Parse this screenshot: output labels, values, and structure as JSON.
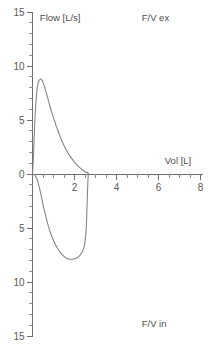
{
  "chart_data": {
    "type": "line",
    "title": "",
    "xlabel": "Vol [L]",
    "ylabel": "Flow [L/s]",
    "xlim": [
      0,
      8
    ],
    "ylim": [
      -15,
      15
    ],
    "grid": false,
    "legend": "none",
    "x_ticks": [
      0,
      2,
      4,
      6,
      8
    ],
    "x_tick_labels": [
      "",
      "2",
      "4",
      "6",
      "8"
    ],
    "y_ticks": [
      15,
      10,
      5,
      0,
      -5,
      -10,
      -15
    ],
    "y_tick_labels": [
      "15",
      "10",
      "5",
      "0",
      "5",
      "10",
      "15"
    ],
    "x_minor_step": 0.5,
    "y_minor_step": 1,
    "annotations": [
      {
        "name": "expiratory-panel-label",
        "text": "F/V ex",
        "x": 5.2,
        "y": 14.2
      },
      {
        "name": "inspiratory-panel-label",
        "text": "F/V in",
        "x": 5.2,
        "y": -14.2
      },
      {
        "name": "y-axis-title",
        "text": "Flow [L/s]",
        "x": 0.35,
        "y": 14.2
      },
      {
        "name": "x-axis-title",
        "text": "Vol [L]",
        "x": 6.3,
        "y": 0.95
      }
    ],
    "series": [
      {
        "name": "expiratory-limb",
        "stroke": "#808080",
        "points": [
          [
            0.0,
            0.0
          ],
          [
            0.04,
            1.4
          ],
          [
            0.07,
            2.9
          ],
          [
            0.1,
            4.3
          ],
          [
            0.13,
            5.6
          ],
          [
            0.17,
            6.8
          ],
          [
            0.21,
            7.7
          ],
          [
            0.26,
            8.35
          ],
          [
            0.31,
            8.65
          ],
          [
            0.38,
            8.78
          ],
          [
            0.44,
            8.72
          ],
          [
            0.5,
            8.48
          ],
          [
            0.57,
            8.1
          ],
          [
            0.64,
            7.62
          ],
          [
            0.72,
            7.08
          ],
          [
            0.8,
            6.5
          ],
          [
            0.88,
            5.95
          ],
          [
            0.96,
            5.42
          ],
          [
            1.04,
            4.98
          ],
          [
            1.1,
            4.62
          ],
          [
            1.18,
            4.18
          ],
          [
            1.27,
            3.7
          ],
          [
            1.36,
            3.24
          ],
          [
            1.46,
            2.8
          ],
          [
            1.57,
            2.36
          ],
          [
            1.69,
            1.95
          ],
          [
            1.82,
            1.56
          ],
          [
            1.95,
            1.22
          ],
          [
            2.08,
            0.92
          ],
          [
            2.2,
            0.68
          ],
          [
            2.32,
            0.48
          ],
          [
            2.42,
            0.34
          ],
          [
            2.5,
            0.22
          ],
          [
            2.56,
            0.14
          ],
          [
            2.6,
            0.18
          ],
          [
            2.63,
            0.12
          ],
          [
            2.66,
            0.02
          ]
        ]
      },
      {
        "name": "inspiratory-limb",
        "stroke": "#808080",
        "points": [
          [
            2.66,
            0.02
          ],
          [
            2.64,
            -0.6
          ],
          [
            2.62,
            -1.6
          ],
          [
            2.6,
            -2.8
          ],
          [
            2.58,
            -4.0
          ],
          [
            2.56,
            -5.0
          ],
          [
            2.53,
            -5.8
          ],
          [
            2.49,
            -6.4
          ],
          [
            2.44,
            -6.85
          ],
          [
            2.37,
            -7.2
          ],
          [
            2.28,
            -7.48
          ],
          [
            2.18,
            -7.68
          ],
          [
            2.06,
            -7.82
          ],
          [
            1.94,
            -7.88
          ],
          [
            1.82,
            -7.9
          ],
          [
            1.7,
            -7.86
          ],
          [
            1.58,
            -7.75
          ],
          [
            1.47,
            -7.58
          ],
          [
            1.36,
            -7.35
          ],
          [
            1.26,
            -7.08
          ],
          [
            1.16,
            -6.78
          ],
          [
            1.06,
            -6.42
          ],
          [
            0.97,
            -6.02
          ],
          [
            0.88,
            -5.58
          ],
          [
            0.8,
            -5.1
          ],
          [
            0.72,
            -4.58
          ],
          [
            0.65,
            -4.05
          ],
          [
            0.58,
            -3.5
          ],
          [
            0.51,
            -2.92
          ],
          [
            0.45,
            -2.35
          ],
          [
            0.39,
            -1.8
          ],
          [
            0.33,
            -1.28
          ],
          [
            0.27,
            -0.82
          ],
          [
            0.2,
            -0.42
          ],
          [
            0.13,
            -0.15
          ],
          [
            0.06,
            -0.03
          ],
          [
            0.01,
            0.0
          ]
        ]
      }
    ]
  },
  "axes_geometry": {
    "x0_px": 32.5,
    "y0_px": 174.0,
    "px_per_x": 21.0,
    "px_per_y": 10.8
  }
}
